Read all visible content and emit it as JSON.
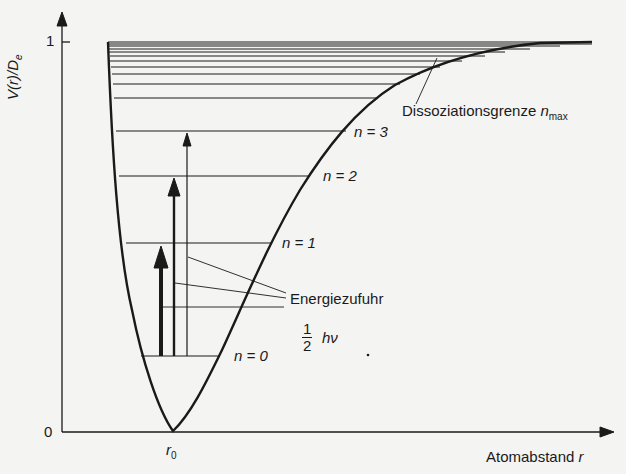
{
  "diagram": {
    "y_axis": {
      "label": "V(r)/D",
      "label_subscript": "e",
      "ticks": [
        {
          "value": "1"
        },
        {
          "value": "0"
        }
      ]
    },
    "x_axis": {
      "label": "Atomabstand ",
      "label_var": "r",
      "tick_label": "r",
      "tick_label_subscript": "0"
    },
    "levels": [
      {
        "label": "n = 0",
        "y": 355
      },
      {
        "label": "n = 1",
        "y": 243
      },
      {
        "label": "n = 2",
        "y": 176
      },
      {
        "label": "n = 3",
        "y": 131
      }
    ],
    "upper_level_ys": [
      98,
      84,
      74,
      67,
      61,
      56,
      52,
      49,
      46,
      44,
      42
    ],
    "annotations": {
      "dissociation": "Dissoziationsgrenze ",
      "dissociation_var": "n",
      "dissociation_sub": "max",
      "energy_input": "Energiezufuhr",
      "zero_point_num": "1",
      "zero_point_den": "2",
      "zero_point_suffix": "hν"
    },
    "arrows": [
      {
        "name": "thick",
        "from": "n=0",
        "to": "n=1"
      },
      {
        "name": "medium",
        "from": "n=0",
        "to": "n=2"
      },
      {
        "name": "thin",
        "from": "n=0",
        "to": "n=3"
      }
    ],
    "colors": {
      "ink": "#1a1a1a",
      "background": "#f4f4f2"
    }
  }
}
